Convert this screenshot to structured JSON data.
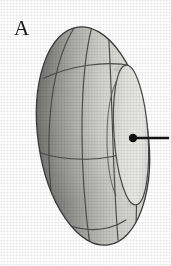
{
  "figure": {
    "panel_label": "A",
    "caption": "",
    "background_color": "#ffffff",
    "ink_color": "#1a1a1a"
  },
  "diagram": {
    "type": "3d-ellipsoid-schematic",
    "object_name": "ellipsoid-body",
    "outer_ellipse": {
      "center_x": 93,
      "center_y": 136,
      "radius_x": 55,
      "radius_y": 110,
      "rotation_deg": -8
    },
    "polar_cap_ellipse": {
      "center_x": 131,
      "center_y": 135,
      "radius_x": 17,
      "radius_y": 70,
      "rotation_deg": -4
    },
    "marker_dot": {
      "center_x": 133,
      "center_y": 138,
      "radius": 4,
      "color": "#111111"
    },
    "arrow": {
      "x_start": 136,
      "y_start": 138,
      "x_end": 169,
      "y_end": 138,
      "stroke_width": 2.4,
      "color": "#111111",
      "direction": "right"
    },
    "meridian_count": 4,
    "parallel_count": 3,
    "mesh_color": "#4a4a4a",
    "shading": {
      "highlight_color": "#e6e6e3",
      "midtone_color": "#c9c9c5",
      "shadow_color": "#8b8b88",
      "deep_shadow_color": "#5e5e5c",
      "cap_color": "#e2e2df",
      "outline_color": "#3a3a3a"
    }
  }
}
